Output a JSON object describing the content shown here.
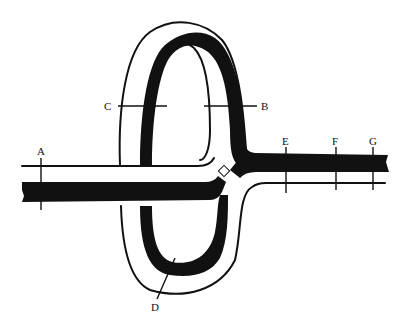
{
  "diagram": {
    "type": "road interchange (loop ramp) diagram",
    "colors": {
      "ink": "#111111",
      "background": "#ffffff"
    },
    "labels": {
      "A": "A",
      "B": "B",
      "C": "C",
      "D": "D",
      "E": "E",
      "F": "F",
      "G": "G"
    }
  }
}
